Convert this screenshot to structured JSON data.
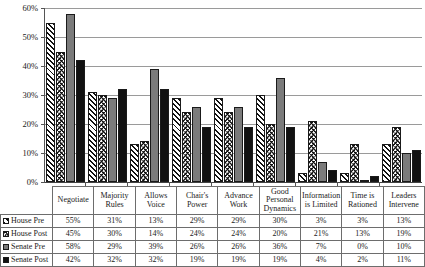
{
  "chart_data": {
    "type": "bar",
    "title": "",
    "xlabel": "",
    "ylabel": "",
    "ylim": [
      0,
      60
    ],
    "ytick_labels": [
      "0%",
      "10%",
      "20%",
      "30%",
      "40%",
      "50%",
      "60%"
    ],
    "ytick_values": [
      0,
      10,
      20,
      30,
      40,
      50,
      60
    ],
    "grid": true,
    "legend_position": "table-row-headers",
    "value_suffix": "%",
    "categories": [
      "Negotiate",
      "Majority Rules",
      "Allows Voice",
      "Chair's Power",
      "Advance Work",
      "Good Personal Dynamics",
      "Information is Limited",
      "Time is Rationed",
      "Leaders Intervene"
    ],
    "series": [
      {
        "name": "House Pre",
        "key": "house-pre",
        "pattern": "diagonal-hatch",
        "color": "#ffffff",
        "values": [
          55,
          31,
          13,
          29,
          29,
          30,
          3,
          3,
          13
        ],
        "labels": [
          "55%",
          "31%",
          "13%",
          "29%",
          "29%",
          "30%",
          "3%",
          "3%",
          "13%"
        ]
      },
      {
        "name": "House Post",
        "key": "house-post",
        "pattern": "chevron-hatch",
        "color": "#ffffff",
        "values": [
          45,
          30,
          14,
          24,
          24,
          20,
          21,
          13,
          19
        ],
        "labels": [
          "45%",
          "30%",
          "14%",
          "24%",
          "24%",
          "20%",
          "21%",
          "13%",
          "19%"
        ]
      },
      {
        "name": "Senate Pre",
        "key": "senate-pre",
        "pattern": "solid",
        "color": "#7b7b7b",
        "values": [
          58,
          29,
          39,
          26,
          26,
          36,
          7,
          0,
          10
        ],
        "labels": [
          "58%",
          "29%",
          "39%",
          "26%",
          "26%",
          "36%",
          "7%",
          "0%",
          "10%"
        ]
      },
      {
        "name": "Senate Post",
        "key": "senate-post",
        "pattern": "solid",
        "color": "#111111",
        "values": [
          42,
          32,
          32,
          19,
          19,
          19,
          4,
          2,
          11
        ],
        "labels": [
          "42%",
          "32%",
          "32%",
          "19%",
          "19%",
          "19%",
          "4%",
          "2%",
          "11%"
        ]
      }
    ]
  },
  "table": {
    "header_row": [
      "",
      "Negotiate",
      "Majority Rules",
      "Allows Voice",
      "Chair's Power",
      "Advance Work",
      "Good Personal Dynamics",
      "Information is Limited",
      "Time is Rationed",
      "Leaders Intervene"
    ],
    "rows": [
      {
        "label": "House Pre",
        "cells": [
          "55%",
          "31%",
          "13%",
          "29%",
          "29%",
          "30%",
          "3%",
          "3%",
          "13%"
        ]
      },
      {
        "label": "House Post",
        "cells": [
          "45%",
          "30%",
          "14%",
          "24%",
          "24%",
          "20%",
          "21%",
          "13%",
          "19%"
        ]
      },
      {
        "label": "Senate Pre",
        "cells": [
          "58%",
          "29%",
          "39%",
          "26%",
          "26%",
          "36%",
          "7%",
          "0%",
          "10%"
        ]
      },
      {
        "label": "Senate Post",
        "cells": [
          "42%",
          "32%",
          "32%",
          "19%",
          "19%",
          "19%",
          "4%",
          "2%",
          "11%"
        ]
      }
    ]
  }
}
